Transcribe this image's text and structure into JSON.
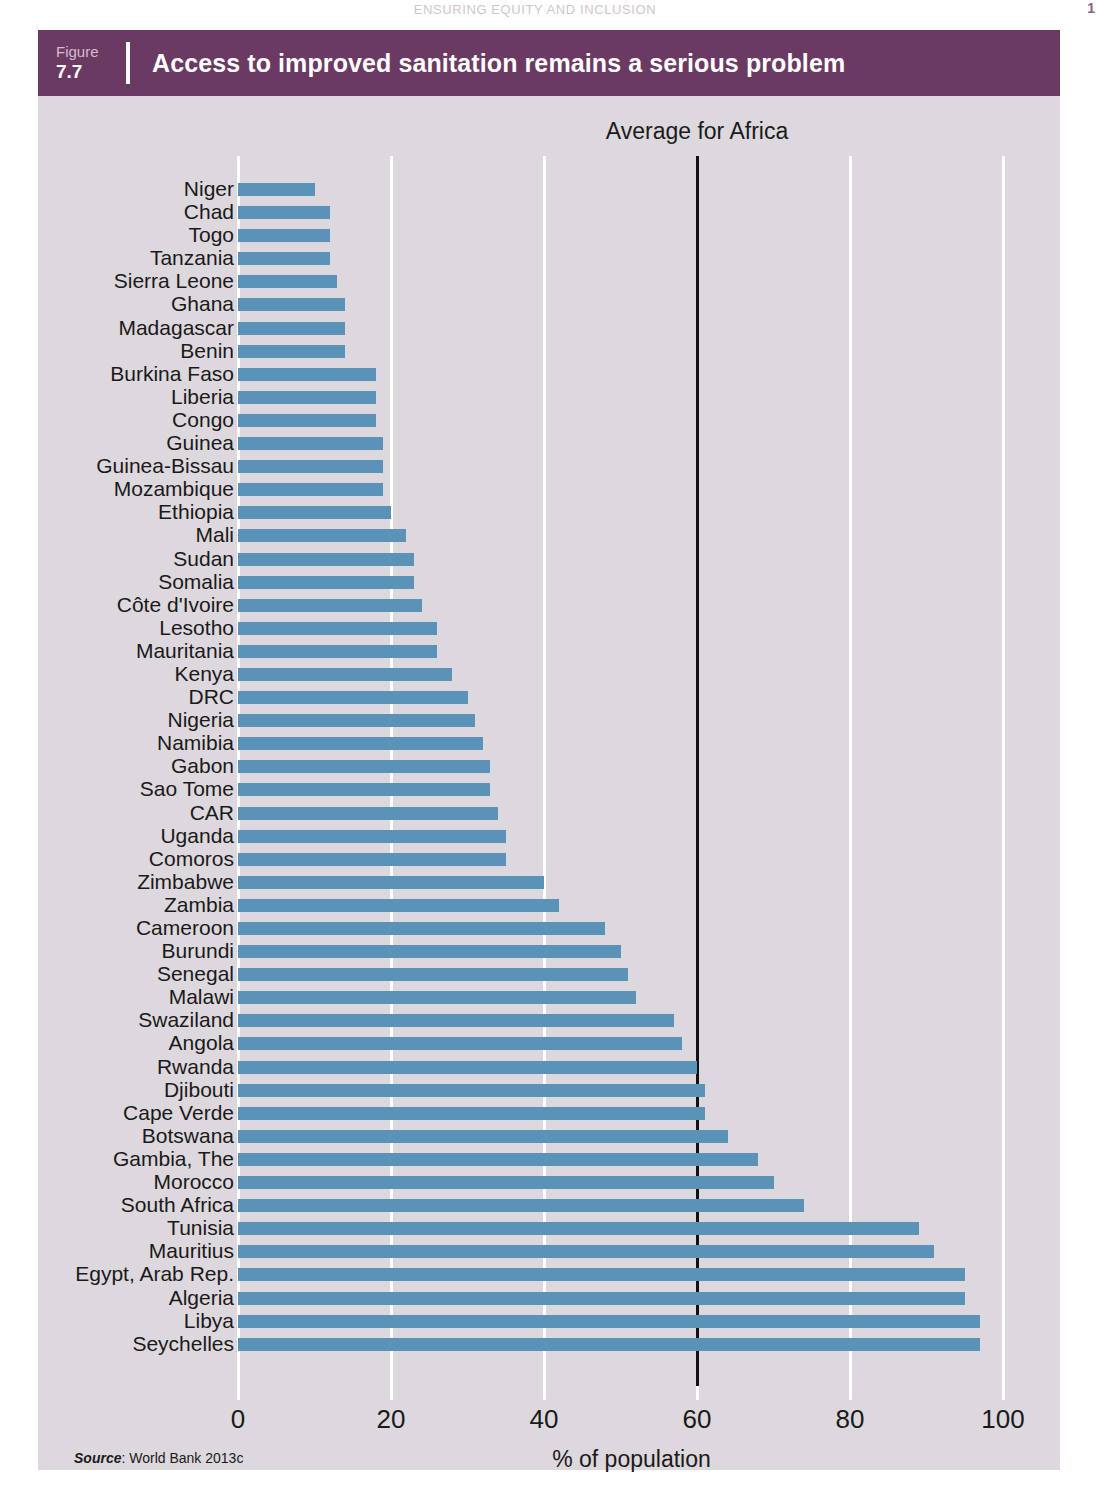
{
  "page": {
    "running_head": "Ensuring equity and inclusion",
    "page_number": "1"
  },
  "figure": {
    "number_label": "Figure",
    "number_value": "7.7",
    "title": "Access to improved sanitation remains a serious problem",
    "source_word": "Source",
    "source_text": ": World Bank 2013c"
  },
  "colors": {
    "header_purple": "#6b3a63",
    "panel_background": "#ddd8dd",
    "bar_blue": "#5b92b8",
    "gridline": "#ffffff",
    "average_line": "#111111"
  },
  "chart_data": {
    "type": "bar",
    "orientation": "horizontal",
    "title": "Access to improved sanitation remains a serious problem",
    "xlabel": "% of population",
    "ylabel": "",
    "xlim": [
      0,
      100
    ],
    "xticks": [
      0,
      20,
      40,
      60,
      80,
      100
    ],
    "xtick_labels": [
      "0",
      "20",
      "40",
      "60",
      "80",
      "100"
    ],
    "grid": "vertical-white",
    "legend": "none",
    "annotations": [
      {
        "label": "Average for Africa",
        "type": "vline",
        "value": 60
      }
    ],
    "categories": [
      "Niger",
      "Chad",
      "Togo",
      "Tanzania",
      "Sierra Leone",
      "Ghana",
      "Madagascar",
      "Benin",
      "Burkina Faso",
      "Liberia",
      "Congo",
      "Guinea",
      "Guinea-Bissau",
      "Mozambique",
      "Ethiopia",
      "Mali",
      "Sudan",
      "Somalia",
      "Côte d'Ivoire",
      "Lesotho",
      "Mauritania",
      "Kenya",
      "DRC",
      "Nigeria",
      "Namibia",
      "Gabon",
      "Sao Tome",
      "CAR",
      "Uganda",
      "Comoros",
      "Zimbabwe",
      "Zambia",
      "Cameroon",
      "Burundi",
      "Senegal",
      "Malawi",
      "Swaziland",
      "Angola",
      "Rwanda",
      "Djibouti",
      "Cape Verde",
      "Botswana",
      "Gambia, The",
      "Morocco",
      "South Africa",
      "Tunisia",
      "Mauritius",
      "Egypt, Arab Rep.",
      "Algeria",
      "Libya",
      "Seychelles"
    ],
    "values": [
      10,
      12,
      12,
      12,
      13,
      14,
      14,
      14,
      18,
      18,
      18,
      19,
      19,
      19,
      20,
      22,
      23,
      23,
      24,
      26,
      26,
      28,
      30,
      31,
      32,
      33,
      33,
      34,
      35,
      35,
      40,
      42,
      48,
      50,
      51,
      52,
      57,
      58,
      60,
      61,
      61,
      64,
      68,
      70,
      74,
      89,
      91,
      95,
      95,
      97,
      97
    ],
    "average_for_africa": 60
  }
}
